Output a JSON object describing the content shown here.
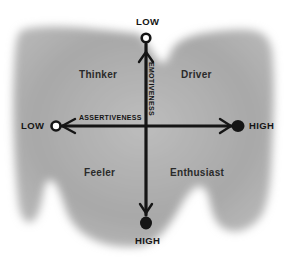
{
  "diagram": {
    "type": "quadrant",
    "colors": {
      "background": "#ffffff",
      "blob": "#a9a9a9",
      "ink": "#151515"
    },
    "axes": {
      "vertical": {
        "name": "EMOTIVENESS",
        "top_label": "LOW",
        "bottom_label": "HIGH",
        "top_marker": "open-circle",
        "bottom_marker": "filled-circle"
      },
      "horizontal": {
        "name": "ASSERTIVENESS",
        "left_label": "LOW",
        "right_label": "HIGH",
        "left_marker": "open-circle",
        "right_marker": "filled-circle"
      }
    },
    "quadrants": {
      "top_left": "Thinker",
      "top_right": "Driver",
      "bottom_left": "Feeler",
      "bottom_right": "Enthusiast"
    }
  }
}
